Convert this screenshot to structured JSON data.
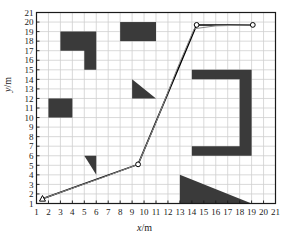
{
  "chart_data": {
    "type": "line",
    "title": "",
    "xlabel": "x/m",
    "ylabel": "y/m",
    "xlim": [
      1,
      21
    ],
    "ylim": [
      1,
      21
    ],
    "xticks": [
      1,
      2,
      3,
      4,
      5,
      6,
      7,
      8,
      9,
      10,
      11,
      12,
      13,
      14,
      15,
      16,
      17,
      18,
      19,
      20,
      21
    ],
    "yticks": [
      1,
      2,
      3,
      4,
      5,
      6,
      7,
      8,
      9,
      10,
      11,
      12,
      13,
      14,
      15,
      16,
      17,
      18,
      19,
      20,
      21
    ],
    "grid": true,
    "legend": "none",
    "series": [
      {
        "name": "planned-path-polyline",
        "style": "solid-black-with-circle-markers",
        "points": [
          [
            1.5,
            1.5
          ],
          [
            9.5,
            5.1
          ],
          [
            14.4,
            19.7
          ],
          [
            19.1,
            19.7
          ]
        ]
      },
      {
        "name": "smoothed-path",
        "style": "thin-gray-curve",
        "points": [
          [
            1.5,
            1.5
          ],
          [
            4.0,
            2.6
          ],
          [
            6.5,
            3.7
          ],
          [
            9.5,
            5.1
          ],
          [
            11.0,
            9.5
          ],
          [
            12.8,
            15.2
          ],
          [
            14.2,
            19.3
          ],
          [
            16.0,
            19.6
          ],
          [
            19.1,
            19.7
          ]
        ]
      }
    ],
    "markers": [
      {
        "name": "start-marker",
        "shape": "triangle-open",
        "x": 1.5,
        "y": 1.5
      },
      {
        "name": "waypoint-marker",
        "shape": "circle-open",
        "x": 9.5,
        "y": 5.1
      },
      {
        "name": "waypoint-marker",
        "shape": "circle-open",
        "x": 14.4,
        "y": 19.7
      },
      {
        "name": "goal-marker",
        "shape": "circle-open",
        "x": 19.1,
        "y": 19.7
      }
    ],
    "obstacles": [
      {
        "name": "obstacle-l-shape-top-left",
        "kind": "polygon",
        "points": [
          [
            3,
            19
          ],
          [
            6,
            19
          ],
          [
            6,
            15
          ],
          [
            5,
            15
          ],
          [
            5,
            17
          ],
          [
            3,
            17
          ]
        ]
      },
      {
        "name": "obstacle-rect-left",
        "kind": "rect",
        "x0": 2,
        "y0": 10,
        "x1": 4,
        "y1": 12
      },
      {
        "name": "obstacle-rect-top-middle",
        "kind": "rect",
        "x0": 8,
        "y0": 18,
        "x1": 11,
        "y1": 20
      },
      {
        "name": "obstacle-triangle-middle",
        "kind": "polygon",
        "points": [
          [
            9,
            14
          ],
          [
            11,
            12
          ],
          [
            9,
            12
          ]
        ]
      },
      {
        "name": "obstacle-triangle-lower-left",
        "kind": "polygon",
        "points": [
          [
            5,
            6
          ],
          [
            6,
            6
          ],
          [
            6,
            4
          ]
        ]
      },
      {
        "name": "obstacle-c-shape-right",
        "kind": "polygon",
        "points": [
          [
            14,
            15
          ],
          [
            19,
            15
          ],
          [
            19,
            6
          ],
          [
            14,
            6
          ],
          [
            14,
            7
          ],
          [
            18,
            7
          ],
          [
            18,
            14
          ],
          [
            14,
            14
          ]
        ]
      },
      {
        "name": "obstacle-triangle-bottom-right",
        "kind": "polygon",
        "points": [
          [
            13,
            4
          ],
          [
            19,
            1
          ],
          [
            13,
            1
          ]
        ]
      }
    ],
    "colors": {
      "obstacle": "#3a3a3a",
      "grid": "#cfcfcf",
      "axis": "#1a1a1a",
      "path": "#000000",
      "smoothed": "#8a8a8a",
      "background": "#ffffff"
    }
  },
  "axes": {
    "x_label_var": "x",
    "x_label_unit": "/m",
    "y_label_var": "y",
    "y_label_unit": "/m"
  }
}
